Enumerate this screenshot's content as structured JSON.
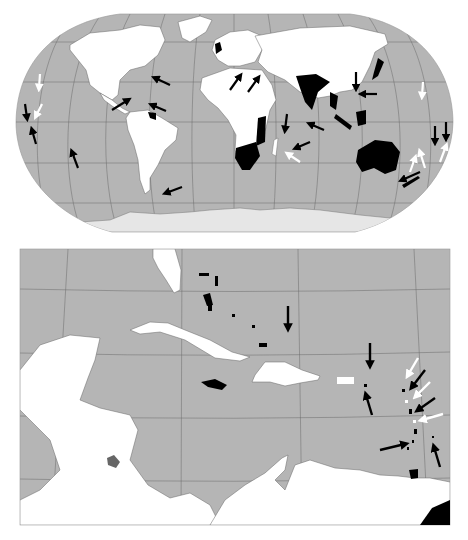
{
  "figure": {
    "type": "map-figure",
    "panels": [
      {
        "id": "world",
        "title": "World map (Robinson-like projection) with highlighted countries and directional arrows",
        "colors": {
          "ocean": "#b5b5b5",
          "land": "#ffffff",
          "highlight": "#000000",
          "antarctica": "#e6e6e6",
          "graticule": "#555555"
        },
        "highlighted_regions": [
          "United Kingdom",
          "India",
          "Southeast Asia (Thailand)",
          "Japan",
          "Borneo/Indonesia",
          "Australia",
          "Southern Africa",
          "East Africa (Tanzania/Mozambique)",
          "Guyana",
          "Sri Lanka",
          "Philippines"
        ],
        "arrows_black_count": 17,
        "arrows_white_count": 7
      },
      {
        "id": "caribbean",
        "title": "Caribbean inset with highlighted islands and directional arrows",
        "colors": {
          "ocean": "#b5b5b5",
          "land": "#ffffff",
          "highlight": "#000000",
          "gray_highlight": "#666666"
        },
        "highlighted_regions": [
          "Bahamas",
          "Jamaica",
          "Trinidad and Tobago",
          "Lesser Antilles islands",
          "Guyana",
          "Lake Nicaragua region (gray)"
        ],
        "arrows_black_count": 7,
        "arrows_white_count": 3
      }
    ],
    "caption": ""
  }
}
